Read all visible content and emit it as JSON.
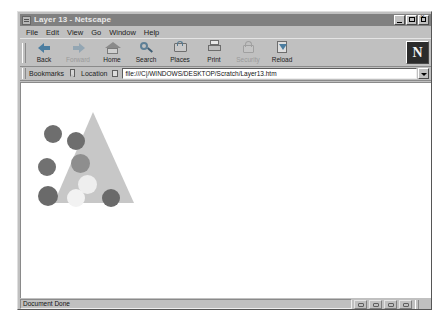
{
  "window": {
    "title": "Layer 13 - Netscape",
    "icon": "netscape-document-icon",
    "controls": [
      {
        "name": "minimize-button",
        "glyph": "_"
      },
      {
        "name": "maximize-button",
        "glyph": "□"
      },
      {
        "name": "close-button",
        "glyph": "×"
      }
    ]
  },
  "menubar": {
    "items": [
      {
        "label": "File"
      },
      {
        "label": "Edit"
      },
      {
        "label": "View"
      },
      {
        "label": "Go"
      },
      {
        "label": "Window"
      },
      {
        "label": "Help"
      }
    ]
  },
  "toolbar": {
    "buttons": [
      {
        "label": "Back",
        "icon": "back-arrow-icon",
        "enabled": true
      },
      {
        "label": "Forward",
        "icon": "forward-arrow-icon",
        "enabled": false
      },
      {
        "label": "Home",
        "icon": "home-icon",
        "enabled": true
      },
      {
        "label": "Search",
        "icon": "search-icon",
        "enabled": true
      },
      {
        "label": "Places",
        "icon": "places-icon",
        "enabled": true
      },
      {
        "label": "Print",
        "icon": "print-icon",
        "enabled": true
      },
      {
        "label": "Security",
        "icon": "security-lock-icon",
        "enabled": false
      },
      {
        "label": "Reload",
        "icon": "reload-icon",
        "enabled": true
      }
    ],
    "brand_logo": "N"
  },
  "locationbar": {
    "bookmarks_label": "Bookmarks",
    "bookmarks_icon": "bookmark-icon",
    "location_label": "Location",
    "location_icon": "page-icon",
    "url": "file:///C|/WINDOWS/DESKTOP/Scratch/Layer13.htm",
    "url_placeholder": "Enter URL",
    "dropdown_icon": "chevron-down-icon"
  },
  "statusbar": {
    "message": "Document Done",
    "icons": [
      {
        "name": "status-icon-online"
      },
      {
        "name": "status-icon-mail"
      },
      {
        "name": "status-icon-security"
      },
      {
        "name": "status-icon-component"
      }
    ]
  },
  "page": {
    "background": "#ffffff",
    "triangle": {
      "name": "gray-triangle",
      "fill": "#c7c7c7",
      "apex_x": 72,
      "left_x": 33,
      "right_x": 113,
      "top_y": 29,
      "base_y": 120
    },
    "circles": [
      {
        "name": "circle-dark-1",
        "cx": 32,
        "cy": 51,
        "r": 9,
        "fill": "#6e6e6e"
      },
      {
        "name": "circle-dark-2",
        "cx": 55,
        "cy": 58,
        "r": 9,
        "fill": "#6e6e6e"
      },
      {
        "name": "circle-mid-3",
        "cx": 59,
        "cy": 80,
        "r": 9.5,
        "fill": "#8e8e8e"
      },
      {
        "name": "circle-dark-4",
        "cx": 26,
        "cy": 84,
        "r": 9,
        "fill": "#717171"
      },
      {
        "name": "circle-light-5",
        "cx": 66,
        "cy": 101,
        "r": 9.5,
        "fill": "#eeeeee"
      },
      {
        "name": "circle-dark-6",
        "cx": 27,
        "cy": 113,
        "r": 10,
        "fill": "#6a6a6a"
      },
      {
        "name": "circle-light-7",
        "cx": 55,
        "cy": 115,
        "r": 9,
        "fill": "#f2f2f2"
      },
      {
        "name": "circle-dark-8",
        "cx": 90,
        "cy": 115,
        "r": 9,
        "fill": "#6a6a6a"
      }
    ]
  }
}
